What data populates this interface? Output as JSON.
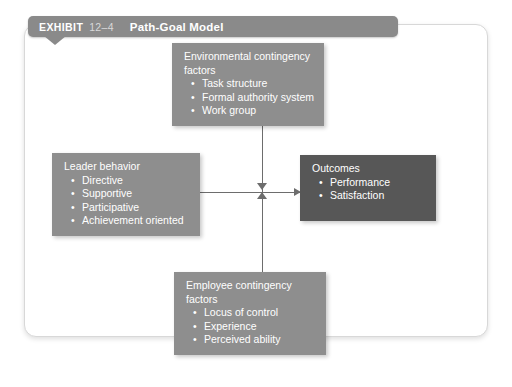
{
  "header": {
    "exhibit_label": "EXHIBIT",
    "exhibit_number": "12–4",
    "title": "Path-Goal Model"
  },
  "nodes": {
    "environmental": {
      "title": "Environmental contingency\nfactors",
      "items": [
        "Task structure",
        "Formal authority system",
        "Work group"
      ]
    },
    "leader": {
      "title": "Leader behavior",
      "items": [
        "Directive",
        "Supportive",
        "Participative",
        "Achievement oriented"
      ]
    },
    "outcomes": {
      "title": "Outcomes",
      "items": [
        "Performance",
        "Satisfaction"
      ]
    },
    "employee": {
      "title": "Employee contingency factors",
      "items": [
        "Locus of control",
        "Experience",
        "Perceived ability"
      ]
    }
  },
  "colors": {
    "box_light": "#8e8e8e",
    "box_dark": "#575757",
    "header_bar": "#8a8a8a",
    "connector": "#6d6d6d",
    "panel_background": "#ffffff"
  }
}
